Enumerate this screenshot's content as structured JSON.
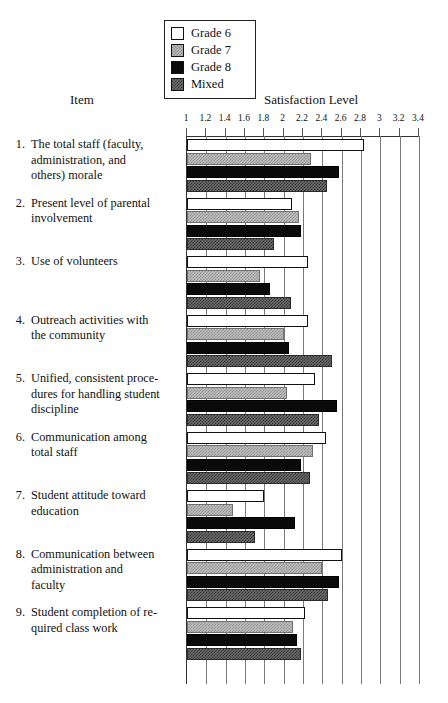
{
  "headers": {
    "item": "Item",
    "axis": "Satisfaction Level"
  },
  "legend": {
    "entries": [
      {
        "label": "Grade 6",
        "swatch": "white-square-icon",
        "color": "#ffffff"
      },
      {
        "label": "Grade 7",
        "swatch": "light-hatch-square-icon",
        "color": "#b9b9b9"
      },
      {
        "label": "Grade 8",
        "swatch": "black-square-icon",
        "color": "#0a0a0a"
      },
      {
        "label": "Mixed",
        "swatch": "dark-hatch-square-icon",
        "color": "#6e6e6e"
      }
    ]
  },
  "chart_data": {
    "type": "bar",
    "orientation": "horizontal",
    "title": "",
    "xlabel": "Satisfaction Level",
    "ylabel": "Item",
    "xlim": [
      1,
      3.4
    ],
    "grid": true,
    "legend_position": "top-center",
    "tick_labels": [
      "1",
      "1.2",
      "1.4",
      "1.6",
      "1.8",
      "2",
      "2.2",
      "2.4",
      "2.6",
      "2.8",
      "3",
      "3.2",
      "3.4"
    ],
    "tick_values": [
      1,
      1.2,
      1.4,
      1.6,
      1.8,
      2,
      2.2,
      2.4,
      2.6,
      2.8,
      3,
      3.2,
      3.4
    ],
    "categories": [
      "The total staff (faculty, administration, and others) morale",
      "Present level of parental involvement",
      "Use of volunteers",
      "Outreach activities with the community",
      "Unified, consistent procedures for handling student discipline",
      "Communication among total staff",
      "Student attitude toward education",
      "Communication between administration and faculty",
      "Student completion of required class work"
    ],
    "category_numbers": [
      "1.",
      "2.",
      "3.",
      "4.",
      "5.",
      "6.",
      "7.",
      "8.",
      "9."
    ],
    "category_lines": [
      [
        "The total staff (faculty,",
        "administration, and",
        "others) morale"
      ],
      [
        "Present level of parental",
        "involvement"
      ],
      [
        "Use of volunteers"
      ],
      [
        "Outreach activities with",
        "the community"
      ],
      [
        "Unified, consistent proce-",
        "dures for handling student",
        "discipline"
      ],
      [
        "Communication among",
        "total staff"
      ],
      [
        "Student attitude toward",
        "education"
      ],
      [
        "Communication between",
        "administration and",
        "faculty"
      ],
      [
        "Student completion of re-",
        "quired class work"
      ]
    ],
    "series": [
      {
        "name": "Grade 6",
        "values": [
          2.83,
          2.09,
          2.25,
          2.25,
          2.32,
          2.44,
          1.8,
          2.6,
          2.22
        ]
      },
      {
        "name": "Grade 7",
        "values": [
          2.28,
          2.16,
          1.75,
          2.0,
          2.03,
          2.3,
          1.48,
          2.4,
          2.1
        ]
      },
      {
        "name": "Grade 8",
        "values": [
          2.57,
          2.18,
          1.86,
          2.05,
          2.55,
          2.18,
          2.12,
          2.57,
          2.14
        ]
      },
      {
        "name": "Mixed",
        "values": [
          2.45,
          1.9,
          2.08,
          2.5,
          2.37,
          2.27,
          1.7,
          2.46,
          2.18
        ]
      }
    ]
  }
}
